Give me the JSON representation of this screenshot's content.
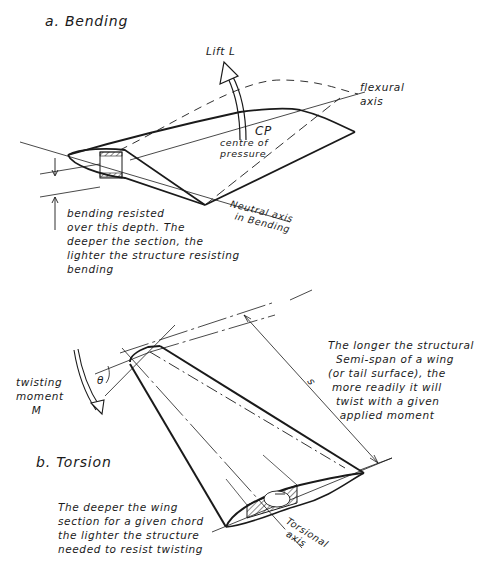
{
  "figure": {
    "part_a": {
      "heading": "a. Bending",
      "lift_label": "Lift L",
      "cp_label": "CP",
      "cp_caption": "centre of\npressure",
      "flexural_axis_label": "flexural\naxis",
      "neutral_axis_label": "Neutral axis\n  in Bending",
      "depth_note": "bending resisted\nover this depth. The\ndeeper the section, the\nlighter the structure resisting\nbending"
    },
    "part_b": {
      "heading": "b. Torsion",
      "moment_label": "twisting\nmoment\n    M",
      "angle_label": "θ",
      "span_label": "s",
      "span_note": "The longer the structural\n  Semi-span of a wing\n(or tail surface), the\n more readily it will\n  twist with a given\n   applied moment",
      "torsional_axis_label": "Torsional\n  axis",
      "depth_note": "The deeper the wing\nsection for a given chord\nthe lighter the structure\nneeded to resist twisting"
    },
    "colors": {
      "ink": "#1a1a1a",
      "paper": "#ffffff"
    }
  }
}
